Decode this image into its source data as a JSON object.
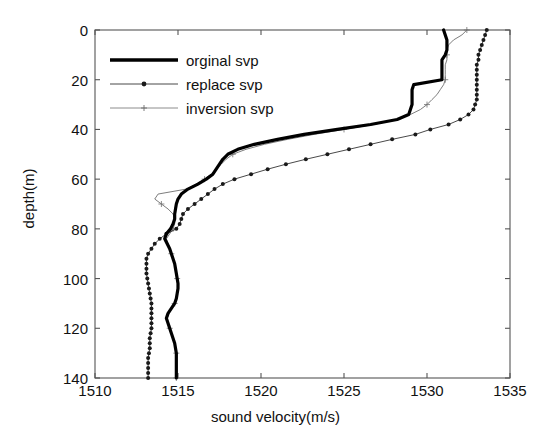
{
  "chart_data": {
    "type": "line",
    "title": "",
    "xlabel": "sound velocity(m/s)",
    "ylabel": "depth(m)",
    "xlim": [
      1510,
      1535
    ],
    "ylim": [
      140,
      0
    ],
    "y_inverted": true,
    "grid": false,
    "xticks": [
      1510,
      1515,
      1520,
      1525,
      1530,
      1535
    ],
    "xtick_labels": [
      "1510",
      "1515",
      "1520",
      "1525",
      "1530",
      "1535"
    ],
    "yticks": [
      0,
      20,
      40,
      60,
      80,
      100,
      120,
      140
    ],
    "ytick_labels": [
      "0",
      "20",
      "40",
      "60",
      "80",
      "100",
      "120",
      "140"
    ],
    "legend_position": "upper left",
    "series": [
      {
        "name": "orginal svp",
        "style": "thick-solid-line",
        "color": "#000000",
        "linewidth": 3.2,
        "marker": "none",
        "x": [
          1531.0,
          1531.1,
          1531.2,
          1531.2,
          1531.2,
          1531.1,
          1530.9,
          1530.9,
          1530.9,
          1530.9,
          1530.9,
          1529.2,
          1529.1,
          1529.1,
          1529.1,
          1529.1,
          1529.0,
          1528.9,
          1528.2,
          1526.6,
          1524.6,
          1522.6,
          1521.0,
          1519.6,
          1518.6,
          1518.0,
          1517.7,
          1517.5,
          1517.3,
          1517.1,
          1516.7,
          1516.2,
          1515.6,
          1515.2,
          1515.0,
          1514.9,
          1514.85,
          1514.8,
          1514.8,
          1514.7,
          1514.55,
          1514.3,
          1514.2,
          1514.35,
          1514.5,
          1514.6,
          1514.7,
          1514.8,
          1514.85,
          1514.9,
          1514.95,
          1515.0,
          1515.0,
          1514.95,
          1514.9,
          1514.8,
          1514.6,
          1514.4,
          1514.3,
          1514.4,
          1514.5,
          1514.6,
          1514.7,
          1514.8,
          1514.85,
          1514.9,
          1514.9,
          1514.9,
          1514.9,
          1514.9,
          1514.9
        ],
        "y": [
          0,
          2,
          4,
          6,
          8,
          10,
          12,
          14,
          16,
          18,
          20,
          22,
          24,
          26,
          28,
          30,
          32,
          34,
          36,
          38,
          40,
          42,
          44,
          46,
          48,
          50,
          52,
          54,
          56,
          58,
          60,
          62,
          64,
          66,
          68,
          70,
          72,
          74,
          76,
          78,
          80,
          82,
          84,
          86,
          88,
          90,
          92,
          94,
          96,
          98,
          100,
          102,
          104,
          106,
          108,
          110,
          112,
          114,
          116,
          118,
          120,
          122,
          124,
          126,
          128,
          130,
          132,
          134,
          136,
          138,
          140
        ]
      },
      {
        "name": "replace svp",
        "style": "thin-line-with-dot-markers",
        "color": "#1a1a1a",
        "linewidth": 0.8,
        "marker": "dot",
        "marker_size": 4.0,
        "x": [
          1533.6,
          1533.5,
          1533.4,
          1533.3,
          1533.2,
          1533.1,
          1533.1,
          1533.0,
          1533.0,
          1533.0,
          1533.0,
          1533.0,
          1533.0,
          1533.0,
          1533.0,
          1532.9,
          1532.8,
          1532.5,
          1532.0,
          1531.3,
          1530.2,
          1529.3,
          1527.9,
          1526.6,
          1525.3,
          1524.0,
          1522.7,
          1521.5,
          1520.4,
          1519.4,
          1518.4,
          1517.7,
          1517.2,
          1516.8,
          1516.4,
          1516.0,
          1515.6,
          1515.3,
          1515.2,
          1515.1,
          1514.9,
          1514.3,
          1513.9,
          1513.6,
          1513.4,
          1513.2,
          1513.1,
          1513.1,
          1513.1,
          1513.1,
          1513.15,
          1513.2,
          1513.25,
          1513.3,
          1513.35,
          1513.4,
          1513.4,
          1513.4,
          1513.4,
          1513.4,
          1513.4,
          1513.35,
          1513.3,
          1513.3,
          1513.3,
          1513.25,
          1513.2,
          1513.2,
          1513.2,
          1513.2,
          1513.2
        ],
        "y": [
          0,
          2,
          4,
          6,
          8,
          10,
          12,
          14,
          16,
          18,
          20,
          22,
          24,
          26,
          28,
          30,
          32,
          34,
          36,
          38,
          40,
          42,
          44,
          46,
          48,
          50,
          52,
          54,
          56,
          58,
          60,
          62,
          64,
          66,
          68,
          70,
          72,
          74,
          76,
          78,
          80,
          82,
          84,
          86,
          88,
          90,
          92,
          94,
          96,
          98,
          100,
          102,
          104,
          106,
          108,
          110,
          112,
          114,
          116,
          118,
          120,
          122,
          124,
          126,
          128,
          130,
          132,
          134,
          136,
          138,
          140
        ]
      },
      {
        "name": "inversion svp",
        "style": "thin-line-with-small-markers",
        "color": "#6e6e6e",
        "linewidth": 0.9,
        "marker": "plus",
        "marker_size": 3.0,
        "x": [
          1532.4,
          1532.1,
          1531.6,
          1531.3,
          1531.2,
          1531.2,
          1531.2,
          1531.1,
          1531.1,
          1531.1,
          1531.1,
          1531.0,
          1530.8,
          1530.6,
          1530.3,
          1530.0,
          1529.6,
          1529.0,
          1528.2,
          1526.8,
          1525.0,
          1523.2,
          1521.6,
          1520.2,
          1519.1,
          1518.3,
          1517.9,
          1517.6,
          1517.3,
          1517.0,
          1516.6,
          1516.1,
          1515.5,
          1513.8,
          1513.6,
          1514.0,
          1514.4,
          1514.7,
          1514.8,
          1514.8,
          1514.7,
          1514.5,
          1514.3,
          1514.4,
          1514.5,
          1514.6,
          1514.7,
          1514.8,
          1514.85,
          1514.9,
          1514.95,
          1515.0,
          1515.0,
          1514.95,
          1514.9,
          1514.8,
          1514.6,
          1514.45,
          1514.35,
          1514.4,
          1514.5,
          1514.6,
          1514.7,
          1514.8,
          1514.85,
          1514.9,
          1514.9,
          1514.9,
          1514.9,
          1514.9,
          1514.9
        ],
        "y": [
          0,
          2,
          4,
          6,
          8,
          10,
          12,
          14,
          16,
          18,
          20,
          22,
          24,
          26,
          28,
          30,
          32,
          34,
          36,
          38,
          40,
          42,
          44,
          46,
          48,
          50,
          52,
          54,
          56,
          58,
          60,
          62,
          64,
          66,
          68,
          70,
          72,
          74,
          76,
          78,
          80,
          82,
          84,
          86,
          88,
          90,
          92,
          94,
          96,
          98,
          100,
          102,
          104,
          106,
          108,
          110,
          112,
          114,
          116,
          118,
          120,
          122,
          124,
          126,
          128,
          130,
          132,
          134,
          136,
          138,
          140
        ]
      }
    ]
  },
  "legend": {
    "entries": [
      {
        "label": "orginal svp"
      },
      {
        "label": "replace svp"
      },
      {
        "label": "inversion svp"
      }
    ]
  },
  "colors": {
    "axis": "#555555",
    "primary": "#000000",
    "secondary": "#1a1a1a",
    "tertiary": "#6e6e6e",
    "background": "#ffffff"
  }
}
